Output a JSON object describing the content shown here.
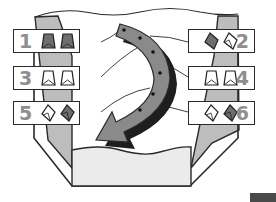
{
  "diagram": {
    "type": "numbered folding sequence diagram",
    "colors": {
      "outline": "#2a2a2a",
      "side_panel": "#bdbdbd",
      "floor_panel": "#ebebeb",
      "arrow_fill": "#8a8a8a",
      "arrow_shadow": "#1e1e1e",
      "number": "#8e8e8e",
      "icon_dark": "#6e6e6e"
    },
    "arrow": {
      "direction": "curved clockwise, top-center to bottom-left",
      "connector_dots": 6
    },
    "steps": [
      {
        "number": "1",
        "side": "left",
        "icons": [
          "trapezoid-dark-icon",
          "trapezoid-dark-icon"
        ]
      },
      {
        "number": "2",
        "side": "right",
        "icons": [
          "diamond-dark-icon",
          "diamond-outline-icon"
        ]
      },
      {
        "number": "3",
        "side": "left",
        "icons": [
          "trapezoid-outline-icon",
          "trapezoid-outline-icon"
        ]
      },
      {
        "number": "4",
        "side": "right",
        "icons": [
          "trapezoid-outline-icon",
          "trapezoid-outline-icon"
        ]
      },
      {
        "number": "5",
        "side": "left",
        "icons": [
          "diamond-outline-icon",
          "diamond-dark-icon"
        ]
      },
      {
        "number": "6",
        "side": "right",
        "icons": [
          "diamond-outline-icon",
          "diamond-dark-icon"
        ]
      }
    ]
  }
}
